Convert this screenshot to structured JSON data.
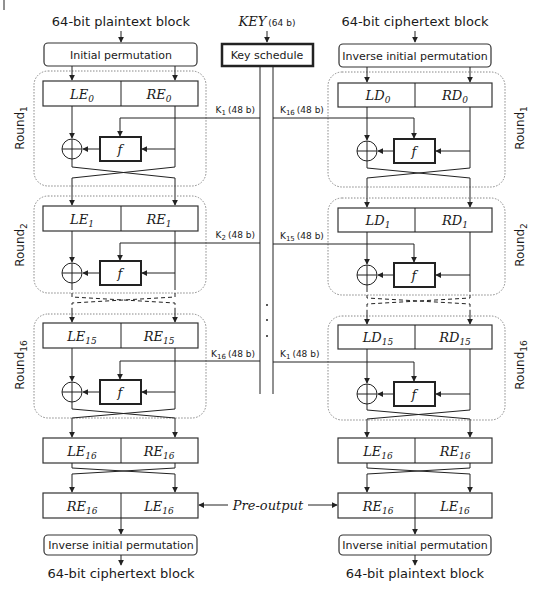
{
  "title_left_top": "64-bit plaintext block",
  "title_right_top": "64-bit ciphertext block",
  "key": {
    "label": "KEY",
    "size": "(64 b)",
    "schedule": "Key schedule"
  },
  "left": {
    "top_box": "Initial permutation",
    "bottom_box": "Inverse initial permutation",
    "bottom_label": "64-bit ciphertext block",
    "rounds": [
      {
        "name": "Round",
        "sub": "1",
        "L": "LE",
        "Lsub": "0",
        "R": "RE",
        "Rsub": "0",
        "key": "K",
        "keysub": "1",
        "keysize": "(48 b)"
      },
      {
        "name": "Round",
        "sub": "2",
        "L": "LE",
        "Lsub": "1",
        "R": "RE",
        "Rsub": "1",
        "key": "K",
        "keysub": "2",
        "keysize": "(48 b)"
      },
      {
        "name": "Round",
        "sub": "16",
        "L": "LE",
        "Lsub": "15",
        "R": "RE",
        "Rsub": "15",
        "key": "K",
        "keysub": "16",
        "keysize": "(48 b)"
      }
    ],
    "final": {
      "L": "LE",
      "Lsub": "16",
      "R": "RE",
      "Rsub": "16"
    },
    "swapped": {
      "L": "RE",
      "Lsub": "16",
      "R": "LE",
      "Rsub": "16"
    }
  },
  "right": {
    "top_box": "Inverse initial permutation",
    "bottom_box": "Inverse initial permutation",
    "bottom_label": "64-bit plaintext block",
    "rounds": [
      {
        "name": "Round",
        "sub": "1",
        "L": "LD",
        "Lsub": "0",
        "R": "RD",
        "Rsub": "0",
        "key": "K",
        "keysub": "16",
        "keysize": "(48 b)"
      },
      {
        "name": "Round",
        "sub": "2",
        "L": "LD",
        "Lsub": "1",
        "R": "RD",
        "Rsub": "1",
        "key": "K",
        "keysub": "15",
        "keysize": "(48 b)"
      },
      {
        "name": "Round",
        "sub": "16",
        "L": "LD",
        "Lsub": "15",
        "R": "RD",
        "Rsub": "15",
        "key": "K",
        "keysub": "1",
        "keysize": "(48 b)"
      }
    ],
    "final": {
      "L": "LE",
      "Lsub": "16",
      "R": "RE",
      "Rsub": "16"
    },
    "swapped": {
      "L": "RE",
      "Lsub": "16",
      "R": "LE",
      "Rsub": "16"
    }
  },
  "f_label": "f",
  "pre_output": "Pre-output"
}
